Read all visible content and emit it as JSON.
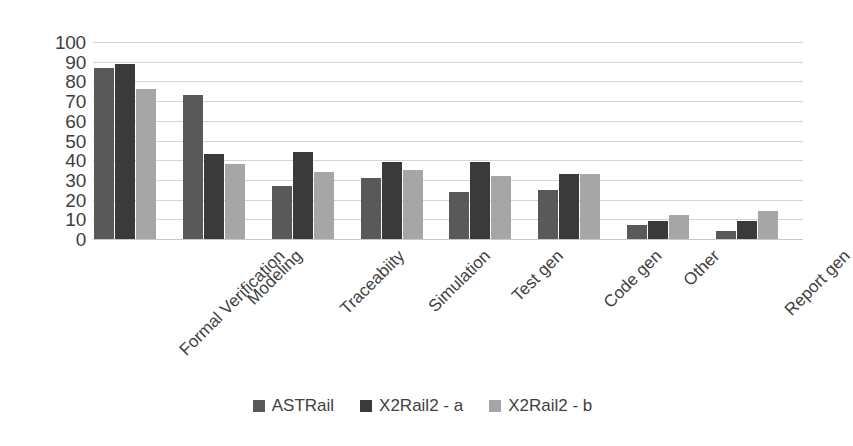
{
  "chart_data": {
    "type": "bar",
    "title": "",
    "subtitle": "",
    "xlabel": "",
    "ylabel": "",
    "ylim": [
      0,
      100
    ],
    "ytick_step": 10,
    "yticks": [
      "0",
      "10",
      "20",
      "30",
      "40",
      "50",
      "60",
      "70",
      "80",
      "90",
      "100"
    ],
    "grid": true,
    "grid_axis": "y",
    "legend_position": "bottom-center",
    "categories": [
      "Formal Verification",
      "Modeling",
      "Traceabiity",
      "Simulation",
      "Test gen",
      "Code gen",
      "Other",
      "Report gen"
    ],
    "series": [
      {
        "name": "ASTRail",
        "color": "#595959",
        "values": [
          87,
          73,
          27,
          31,
          24,
          25,
          7,
          4
        ]
      },
      {
        "name": "X2Rail2 - a",
        "color": "#3a3a3a",
        "values": [
          89,
          43,
          44,
          39,
          39,
          33,
          9,
          9
        ]
      },
      {
        "name": "X2Rail2 - b",
        "color": "#a6a6a6",
        "values": [
          76,
          38,
          34,
          35,
          32,
          33,
          12,
          14
        ]
      }
    ]
  }
}
